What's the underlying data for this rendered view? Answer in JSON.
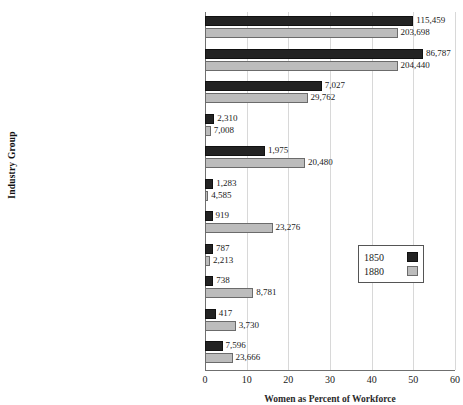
{
  "chart_data": {
    "type": "bar",
    "orientation": "horizontal",
    "title": "",
    "xlabel": "Women as Percent of Workforce",
    "ylabel": "Industry Group",
    "xlim": [
      0,
      60
    ],
    "xticks": [
      0,
      10,
      20,
      30,
      40,
      50,
      60
    ],
    "grid": true,
    "legend_position": "center-right",
    "categories": [
      "Clothing Industries",
      "Textile Industries",
      "Paper and Printing",
      "Lumber and Lumber Products",
      "Tobacco and Cigars",
      "Iron, Steel, and Their Products",
      "Food and Kindred Products",
      "Clay, Glass, and Stone Products",
      "Metals nd Metal Products\nOther than Iron and Steel",
      "Chemicals and Allied Products",
      "Other Manufacturing Industries"
    ],
    "series": [
      {
        "name": "1850",
        "color": "#232323",
        "values": [
          50.0,
          52.3,
          28.0,
          2.2,
          14.4,
          2.0,
          1.8,
          1.9,
          2.0,
          2.6,
          4.2
        ],
        "labels": [
          "115,459",
          "86,787",
          "7,027",
          "2,310",
          "1,975",
          "1,283",
          "919",
          "787",
          "738",
          "417",
          "7,596"
        ]
      },
      {
        "name": "1880",
        "color": "#bcbcbc",
        "values": [
          46.2,
          46.2,
          24.6,
          1.4,
          24.0,
          0.8,
          16.2,
          1.2,
          11.6,
          7.4,
          6.6
        ],
        "labels": [
          "203,698",
          "204,440",
          "29,762",
          "7,008",
          "20,480",
          "4,585",
          "23,276",
          "2,213",
          "8,781",
          "3,730",
          "23,666"
        ]
      }
    ]
  },
  "legend": {
    "items": [
      {
        "label": "1850",
        "swatch": "black-square-swatch"
      },
      {
        "label": "1880",
        "swatch": "gray-square-swatch"
      }
    ]
  }
}
